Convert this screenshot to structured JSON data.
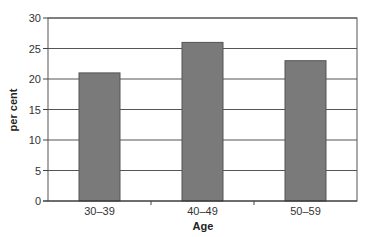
{
  "chart_data": {
    "type": "bar",
    "title": "",
    "xlabel": "Age",
    "ylabel": "per cent",
    "categories": [
      "30–39",
      "40–49",
      "50–59"
    ],
    "values": [
      21,
      26,
      23
    ],
    "ylim": [
      0,
      30
    ],
    "yticks": [
      0,
      5,
      10,
      15,
      20,
      25,
      30
    ],
    "grid": true,
    "legend": null,
    "bar_color": "#7a7a7a",
    "grid_color": "#555555"
  }
}
